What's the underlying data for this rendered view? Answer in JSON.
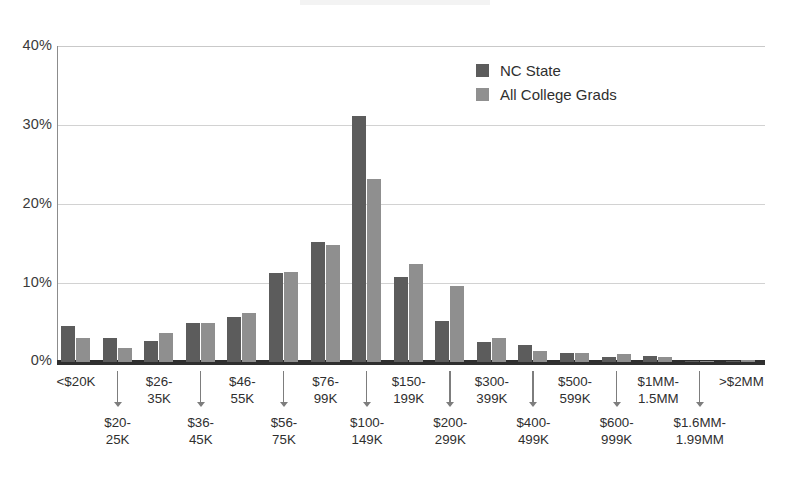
{
  "chart_data": {
    "type": "bar",
    "title": "",
    "subtitle": "",
    "xlabel": "",
    "ylabel": "",
    "ylim": [
      0,
      40
    ],
    "yticks": [
      0,
      10,
      20,
      30,
      40
    ],
    "ytick_labels": [
      "0%",
      "10%",
      "20%",
      "30%",
      "40%"
    ],
    "grid": true,
    "legend_position": "top-right",
    "value_unit": "%",
    "categories": [
      "<$20K",
      "$20-25K",
      "$26-35K",
      "$36-45K",
      "$46-55K",
      "$56-75K",
      "$76-99K",
      "$100-149K",
      "$150-199K",
      "$200-299K",
      "$300-399K",
      "$400-499K",
      "$500-599K",
      "$600-999K",
      "$1MM-1.5MM",
      "$1.6MM-1.99MM",
      ">$2MM"
    ],
    "series": [
      {
        "name": "NC State",
        "color": "#5c5c5c",
        "values": [
          4.5,
          3.1,
          2.7,
          5.0,
          5.7,
          11.3,
          15.2,
          31.1,
          10.8,
          5.2,
          2.5,
          2.2,
          1.1,
          0.6,
          0.7,
          0.1,
          0.1
        ]
      },
      {
        "name": "All College Grads",
        "color": "#8f8f8f",
        "values": [
          3.0,
          1.8,
          3.7,
          5.0,
          6.2,
          11.4,
          14.8,
          23.2,
          12.4,
          9.6,
          3.0,
          1.4,
          1.1,
          1.0,
          0.6,
          0.1,
          0.3
        ]
      }
    ]
  },
  "legend": {
    "items": [
      {
        "label": "NC State",
        "color": "#5c5c5c"
      },
      {
        "label": "All College Grads",
        "color": "#8f8f8f"
      }
    ]
  },
  "axis": {
    "y_ticks": [
      "40%",
      "30%",
      "20%",
      "10%",
      "0%"
    ],
    "x_labels_row1": [
      "<$20K",
      "$26-\n35K",
      "$46-\n55K",
      "$76-\n99K",
      "$150-\n199K",
      "$300-\n399K",
      "$500-\n599K",
      "$1MM-\n1.5MM",
      ">$2MM"
    ],
    "x_labels_row2": [
      "$20-\n25K",
      "$36-\n45K",
      "$56-\n75K",
      "$100-\n149K",
      "$200-\n299K",
      "$400-\n499K",
      "$600-\n999K",
      "$1.6MM-\n1.99MM"
    ]
  }
}
